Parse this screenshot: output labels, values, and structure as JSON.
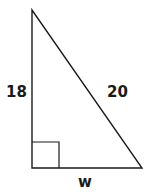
{
  "diagram": {
    "type": "right-triangle",
    "vertices": {
      "top": [
        32,
        10
      ],
      "bottom_left": [
        32,
        168
      ],
      "bottom_right": [
        142,
        168
      ]
    },
    "right_angle_marker": {
      "x": 32,
      "y": 142,
      "size": 26
    },
    "labels": {
      "vertical_leg": "18",
      "hypotenuse": "20",
      "horizontal_leg": "w"
    },
    "stroke_color": "#1a1a1a"
  }
}
